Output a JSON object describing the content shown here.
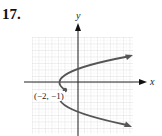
{
  "problem": {
    "number": "17."
  },
  "axes": {
    "x_label": "x",
    "y_label": "y"
  },
  "point": {
    "label": "(−2, −1)",
    "x": -2,
    "y": -1
  },
  "curve": {
    "description": "Parabola opening right with vertex at (-2, -1)",
    "vertex": [
      -2,
      -1
    ],
    "color": "#555555"
  },
  "grid": {
    "color": "#c8c8c8",
    "axis_color": "#222222"
  }
}
